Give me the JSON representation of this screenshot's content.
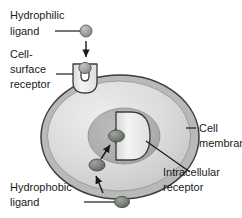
{
  "diagram": {
    "labels": {
      "hydrophilic_ligand": {
        "line1": "Hydrophilic",
        "line2": "ligand"
      },
      "cell_surface_receptor": {
        "line1": "Cell-",
        "line2": "surface",
        "line3": "receptor"
      },
      "cell_membrane": {
        "line1": "Cell",
        "line2": "membrane"
      },
      "intracellular_receptor": {
        "line1": "Intracellular",
        "line2": "receptor"
      },
      "hydrophobic_ligand": {
        "line1": "Hydrophobic",
        "line2": "ligand"
      }
    },
    "colors": {
      "background": "#ffffff",
      "text": "#1a1a1a",
      "outline": "#3c3c3c",
      "cytoplasm_light": "#e2e2e2",
      "cytoplasm_mid": "#cfcfcf",
      "membrane_band": "#b4b4b4",
      "nucleus": "#b0b0b0",
      "nucleus_inner": "#a8a8a8",
      "receptor_white": "#f2f2f2",
      "ligand_dark": "#787d78",
      "ligand_light": "#9a9a9a",
      "leader_line": "#1a1a1a"
    }
  }
}
